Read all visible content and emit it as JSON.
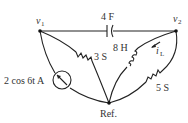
{
  "nodes": {
    "v1": {
      "label": "v",
      "sub": "1"
    },
    "v2": {
      "label": "v",
      "sub": "2"
    },
    "ref": {
      "label": "Ref."
    }
  },
  "components": {
    "capacitor": {
      "label": "4 F"
    },
    "inductor": {
      "label": "8 H"
    },
    "resistor_3": {
      "label": "3 S"
    },
    "resistor_5": {
      "label": "5 S"
    },
    "source": {
      "label": "2 cos 6t A"
    },
    "current_label": {
      "label": "i",
      "sub": "L"
    }
  },
  "colors": {
    "wire": "#222222",
    "text": "#333333"
  }
}
